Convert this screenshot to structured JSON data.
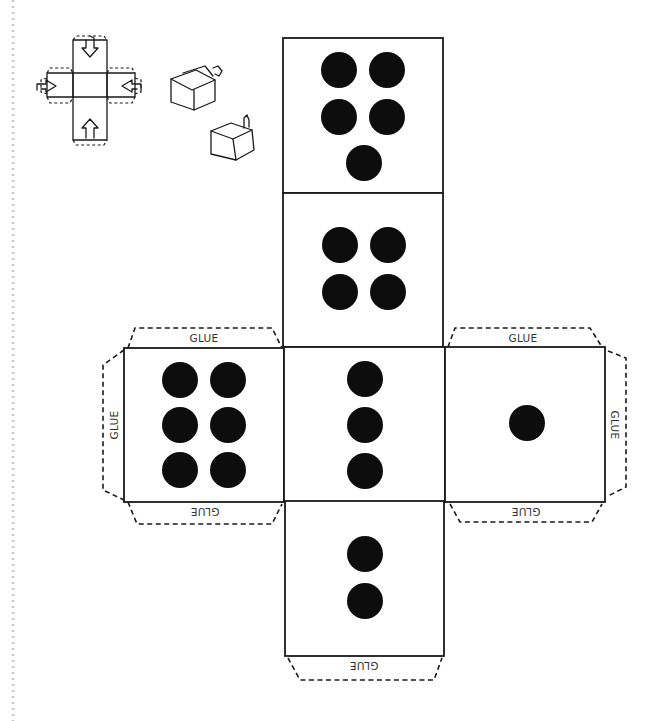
{
  "diagram": {
    "glue_label": "GLUE",
    "colors": {
      "line": "#1a1a1a",
      "pip": "#0d0d0d",
      "background": "#ffffff"
    },
    "faces": [
      {
        "name": "five",
        "value": 5,
        "position": "top"
      },
      {
        "name": "four",
        "value": 4,
        "position": "upper-middle"
      },
      {
        "name": "six",
        "value": 6,
        "position": "left"
      },
      {
        "name": "three",
        "value": 3,
        "position": "center"
      },
      {
        "name": "one",
        "value": 1,
        "position": "right"
      },
      {
        "name": "two",
        "value": 2,
        "position": "bottom"
      }
    ],
    "glue_tabs": [
      {
        "face": "six",
        "side": "top",
        "label": "GLUE"
      },
      {
        "face": "six",
        "side": "left",
        "label": "GLUE"
      },
      {
        "face": "six",
        "side": "bottom",
        "label": "GLUE"
      },
      {
        "face": "one",
        "side": "top",
        "label": "GLUE"
      },
      {
        "face": "one",
        "side": "right",
        "label": "GLUE"
      },
      {
        "face": "one",
        "side": "bottom",
        "label": "GLUE"
      },
      {
        "face": "two",
        "side": "bottom",
        "label": "GLUE"
      }
    ],
    "instructions": {
      "net_sketch": "folding-net-diagram-icon",
      "cube_sketches": [
        "folding-cube-icon",
        "closing-cube-icon"
      ]
    }
  }
}
